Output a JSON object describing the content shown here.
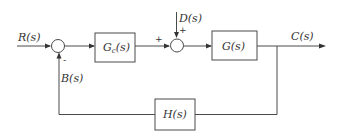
{
  "diagram": {
    "type": "closed-loop control block diagram",
    "signals": {
      "input": "R(s)",
      "disturbance": "D(s)",
      "output": "C(s)",
      "feedback": "B(s)"
    },
    "blocks": {
      "controller": {
        "main": "G",
        "sub": "c",
        "arg": "(s)"
      },
      "plant": "G(s)",
      "feedback": "H(s)"
    },
    "junctions": {
      "summing_1": {
        "feedback_sign": "-"
      },
      "summing_2": {
        "forward_sign": "+",
        "disturbance_sign": "+"
      }
    }
  }
}
